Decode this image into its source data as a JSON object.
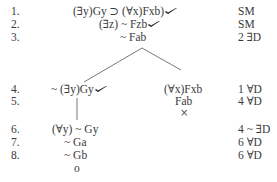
{
  "tree": {
    "lines": [
      {
        "number": "1.",
        "formula": "(∃y)Gy ⊃ (∀x)Fxb)",
        "checked": true,
        "justification": "SM"
      },
      {
        "number": "2.",
        "formula": "(∃z) ~ Fzb",
        "checked": true,
        "justification": "SM"
      },
      {
        "number": "3.",
        "formula": "~ Fab",
        "checked": false,
        "justification": "2 ∃D"
      },
      {
        "number": "4.",
        "left_formula": "~ (∃y)Gy",
        "left_checked": true,
        "right_formula": "(∀x)Fxb",
        "justification": "1 ∀D"
      },
      {
        "number": "5.",
        "left_formula": "",
        "right_formula": "Fab",
        "justification": "4 ∀D"
      },
      {
        "number": "6.",
        "formula": "(∀y) ~ Gy",
        "checked": false,
        "justification": "4 ~ ∃D"
      },
      {
        "number": "7.",
        "formula": "~ Ga",
        "checked": false,
        "justification": "6 ∀D"
      },
      {
        "number": "8.",
        "formula": "~ Gb",
        "checked": false,
        "justification": "6 ∀D"
      }
    ],
    "right_branch_close": "×",
    "left_branch_open": "o"
  },
  "colors": {
    "text": "#3a3a3a",
    "check": "#1a1a1a",
    "branch_line": "#555555"
  }
}
